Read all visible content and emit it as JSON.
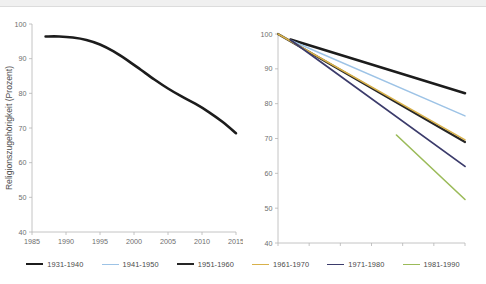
{
  "figure": {
    "background": "#ffffff",
    "topbar_color": "#f0f0f0"
  },
  "legend": {
    "position": "bottom-center",
    "items": [
      {
        "label": "1931-1940",
        "color": "#1c1c1c",
        "width": 2.6
      },
      {
        "label": "1941-1950",
        "color": "#9dc3e6",
        "width": 1.5
      },
      {
        "label": "1951-1960",
        "color": "#262626",
        "width": 2.2
      },
      {
        "label": "1961-1970",
        "color": "#d8b14a",
        "width": 1.6
      },
      {
        "label": "1971-1980",
        "color": "#3b3b6b",
        "width": 1.8
      },
      {
        "label": "1981-1990",
        "color": "#9bbb59",
        "width": 1.6
      }
    ]
  },
  "chart_data": [
    {
      "id": "left",
      "type": "line",
      "title": "",
      "xlabel": "",
      "ylabel": "Religionszugehörigkeit (Prozent)",
      "xlim": [
        1985,
        2015
      ],
      "ylim": [
        40,
        100
      ],
      "xticks": [
        1985,
        1990,
        1995,
        2000,
        2005,
        2010,
        2015
      ],
      "yticks": [
        40,
        50,
        60,
        70,
        80,
        90,
        100
      ],
      "grid": false,
      "series": [
        {
          "name": "Gesamt",
          "color": "#1c1c1c",
          "width": 2.6,
          "x": [
            1987,
            1989,
            1991,
            1993,
            1995,
            1997,
            1999,
            2001,
            2003,
            2005,
            2007,
            2009,
            2011,
            2013,
            2015
          ],
          "values": [
            96.4,
            96.4,
            96.1,
            95.4,
            94.1,
            92.1,
            89.6,
            86.8,
            84.0,
            81.4,
            79.1,
            77.0,
            74.6,
            71.8,
            68.5
          ]
        }
      ]
    },
    {
      "id": "right",
      "type": "line",
      "title": "",
      "xlabel": "",
      "ylabel": "",
      "xlim": [
        1985,
        2015
      ],
      "ylim": [
        40,
        100
      ],
      "xticks": [
        1985,
        1990,
        1995,
        2000,
        2005,
        2010,
        2015
      ],
      "yticks": [
        40,
        50,
        60,
        70,
        80,
        90,
        100
      ],
      "grid": false,
      "series": [
        {
          "name": "1931-1940",
          "color": "#1c1c1c",
          "width": 2.6,
          "x": [
            1987,
            2015
          ],
          "values": [
            98.4,
            83.0
          ]
        },
        {
          "name": "1941-1950",
          "color": "#9dc3e6",
          "width": 1.5,
          "x": [
            1987,
            2015
          ],
          "values": [
            98.2,
            76.5
          ]
        },
        {
          "name": "1951-1960",
          "color": "#262626",
          "width": 2.2,
          "x": [
            1985,
            2015
          ],
          "values": [
            100.0,
            69.0
          ]
        },
        {
          "name": "1961-1970",
          "color": "#d8b14a",
          "width": 1.6,
          "x": [
            1985,
            2015
          ],
          "values": [
            100.0,
            69.6
          ]
        },
        {
          "name": "1971-1980",
          "color": "#3b3b6b",
          "width": 1.8,
          "x": [
            1987,
            2015
          ],
          "values": [
            98.3,
            62.0
          ]
        },
        {
          "name": "1981-1990",
          "color": "#9bbb59",
          "width": 1.6,
          "x": [
            2004,
            2015
          ],
          "values": [
            71.0,
            52.5
          ]
        }
      ]
    }
  ]
}
